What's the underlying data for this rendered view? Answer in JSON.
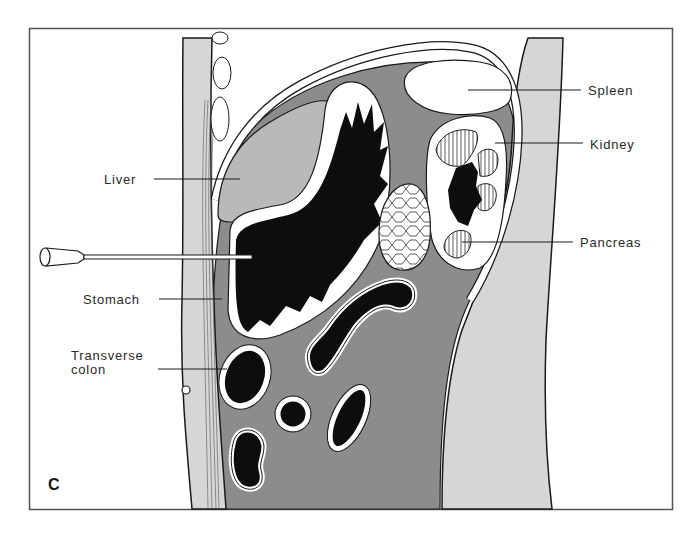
{
  "figure": {
    "panel_letter": "C",
    "labels": {
      "liver": "Liver",
      "stomach": "Stomach",
      "transverse_colon_line1": "Transverse",
      "transverse_colon_line2": "colon",
      "spleen": "Spleen",
      "kidney": "Kidney",
      "pancreas": "Pancreas"
    },
    "colors": {
      "background": "#ffffff",
      "frame": "#555555",
      "outline": "#1a1a1a",
      "abdominal_wall": "#d6d6d6",
      "peritoneal_cavity": "#8c8c8c",
      "liver": "#b9b9b9",
      "lumen": "#0d0d0d",
      "organ_white": "#ffffff"
    }
  }
}
